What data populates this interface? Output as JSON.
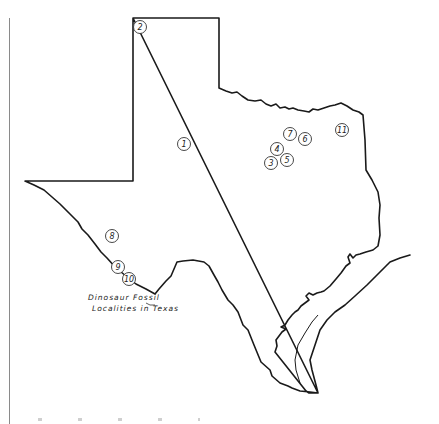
{
  "map": {
    "title_line1": "Dinosaur Fossil",
    "title_line2": "Localities in Texas",
    "outline_color": "#1a1a1a",
    "localities": [
      {
        "label": "1",
        "x": 184,
        "y": 144
      },
      {
        "label": "2",
        "x": 140,
        "y": 27
      },
      {
        "label": "3",
        "x": 271,
        "y": 163
      },
      {
        "label": "4",
        "x": 277,
        "y": 149
      },
      {
        "label": "5",
        "x": 287,
        "y": 160
      },
      {
        "label": "6",
        "x": 305,
        "y": 139
      },
      {
        "label": "7",
        "x": 290,
        "y": 134
      },
      {
        "label": "8",
        "x": 112,
        "y": 236
      },
      {
        "label": "9",
        "x": 118,
        "y": 267
      },
      {
        "label": "10",
        "x": 129,
        "y": 279
      },
      {
        "label": "11",
        "x": 342,
        "y": 130
      }
    ]
  }
}
